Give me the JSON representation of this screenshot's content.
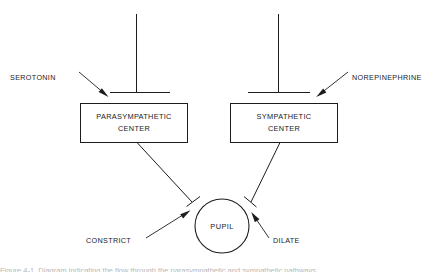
{
  "figure": {
    "background_color": "#ffffff",
    "line_color": "#1c1c1c",
    "text_color": "#1a1a1a",
    "width": 445,
    "height": 274
  },
  "neurotransmitters": {
    "left": {
      "label": "SEROTONIN",
      "x": 10,
      "y": 77
    },
    "right": {
      "label": "NOREPINEPHRINE",
      "x": 352,
      "y": 77
    }
  },
  "boxes": [
    {
      "name": "parasympathetic-center",
      "line1": "PARASYMPATHETIC",
      "line2": "CENTER",
      "x": 80,
      "y": 103,
      "width": 107,
      "height": 39
    },
    {
      "name": "sympathetic-center",
      "line1": "SYMPATHETIC",
      "line2": "CENTER",
      "x": 230,
      "y": 103,
      "width": 107,
      "height": 39
    }
  ],
  "pupil": {
    "label": "PUPIL",
    "cx": 222,
    "cy": 226,
    "r": 27
  },
  "effects": {
    "left": {
      "label": "CONSTRICT",
      "x": 86,
      "y": 240
    },
    "right": {
      "label": "DILATE",
      "x": 273,
      "y": 240
    }
  },
  "caption": {
    "text": "Figure 4-1.  Diagram indicating the flow through the parasympathetic and sympathetic pathways",
    "y": 266,
    "visible_fragment": "cropped"
  }
}
